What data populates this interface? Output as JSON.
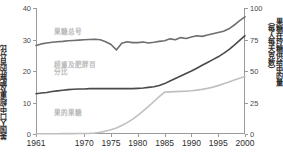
{
  "axes": {
    "y_left_title": "美国人口中超重及肥胖的百分比",
    "y_right_title_1": "果糖在玲糖供给中的量",
    "y_right_title_2": "（每人每天克数）",
    "y_left_ticks": [
      "0",
      "10",
      "20",
      "30",
      "40"
    ],
    "y_right_ticks": [
      "0",
      "25",
      "50",
      "75",
      "100"
    ],
    "x_ticks": [
      "1961",
      "1970",
      "1975",
      "1980",
      "1985",
      "1990",
      "1995",
      "2000"
    ]
  },
  "annotations": {
    "total_sugar": "果糖总号",
    "obesity": "超重及肥胖百\n分比",
    "fructose": "果的果糖"
  },
  "colors": {
    "total_sugar": "#6e6e6e",
    "obesity": "#4a4a4a",
    "fructose": "#c0c0c0",
    "axis": "#9a9a9a",
    "label": "#b9b9b9"
  },
  "chart_data": {
    "type": "line",
    "title": "",
    "xlabel": "",
    "ylabel": "美国人口中超重及肥胖的百分比",
    "ylabel_right": "果糖在玲糖供给中的量（每人每天克数）",
    "grid": false,
    "legend": "inline-annotations",
    "xlim": [
      1961,
      2000
    ],
    "ylim_left": [
      0,
      40
    ],
    "ylim_right": [
      0,
      100
    ],
    "x": [
      1961,
      1962,
      1963,
      1964,
      1965,
      1966,
      1967,
      1968,
      1969,
      1970,
      1971,
      1972,
      1973,
      1974,
      1975,
      1976,
      1977,
      1978,
      1979,
      1980,
      1981,
      1982,
      1983,
      1984,
      1985,
      1986,
      1987,
      1988,
      1989,
      1990,
      1991,
      1992,
      1993,
      1994,
      1995,
      1996,
      1997,
      1998,
      1999,
      2000
    ],
    "series": [
      {
        "name": "果糖总号",
        "axis": "left",
        "units": "%",
        "color": "#6e6e6e",
        "values": [
          28.1,
          28.6,
          28.9,
          29.1,
          29.3,
          29.4,
          29.6,
          29.7,
          29.8,
          29.9,
          30.0,
          30.1,
          29.9,
          29.3,
          28.4,
          26.7,
          28.8,
          29.3,
          29.0,
          29.0,
          29.2,
          28.9,
          29.1,
          29.4,
          29.6,
          30.2,
          29.9,
          30.6,
          30.3,
          30.8,
          31.2,
          31.0,
          31.4,
          31.8,
          32.2,
          32.6,
          33.4,
          34.6,
          36.0,
          37.2
        ]
      },
      {
        "name": "超重及肥胖百分比",
        "axis": "left",
        "units": "%",
        "color": "#4a4a4a",
        "values": [
          12.8,
          13.0,
          13.2,
          13.5,
          13.7,
          13.9,
          14.1,
          14.2,
          14.3,
          14.3,
          14.4,
          14.4,
          14.4,
          14.4,
          14.4,
          14.4,
          14.4,
          14.4,
          14.4,
          14.5,
          14.6,
          14.8,
          15.0,
          15.4,
          16.0,
          16.8,
          17.6,
          18.4,
          19.2,
          20.0,
          20.9,
          21.8,
          22.7,
          23.6,
          24.5,
          25.6,
          26.8,
          28.2,
          29.7,
          31.2
        ]
      },
      {
        "name": "果的果糖",
        "axis": "right",
        "units": "g/person/day",
        "color": "#c0c0c0",
        "values": [
          0.2,
          0.2,
          0.2,
          0.2,
          0.2,
          0.3,
          0.3,
          0.3,
          0.4,
          0.4,
          0.5,
          0.8,
          1.4,
          2.3,
          3.4,
          4.8,
          6.8,
          9.0,
          11.6,
          14.8,
          18.3,
          22.0,
          25.8,
          29.6,
          33.2,
          33.4,
          33.6,
          33.8,
          34.0,
          34.3,
          34.8,
          35.4,
          36.2,
          37.2,
          38.4,
          39.8,
          41.3,
          42.8,
          44.2,
          45.6
        ]
      }
    ]
  }
}
